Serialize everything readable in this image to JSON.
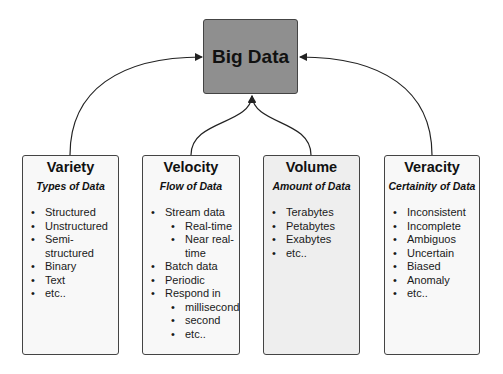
{
  "hub": {
    "title": "Big Data"
  },
  "cards": [
    {
      "title": "Variety",
      "subtitle": "Types of Data",
      "items": [
        "Structured",
        "Unstructured",
        "Semi-structured",
        "Binary",
        "Text",
        "etc.."
      ]
    },
    {
      "title": "Velocity",
      "subtitle": "Flow of Data",
      "items": [
        "Stream data",
        "Batch data",
        "Periodic",
        "Respond in"
      ],
      "stream_sub": [
        "Real-time",
        "Near real-time"
      ],
      "respond_sub": [
        "millisecond",
        "second",
        "etc.."
      ]
    },
    {
      "title": "Volume",
      "subtitle": "Amount of Data",
      "items": [
        "Terabytes",
        "Petabytes",
        "Exabytes",
        "etc.."
      ]
    },
    {
      "title": "Veracity",
      "subtitle": "Certainity of Data",
      "items": [
        "Inconsistent",
        "Incomplete",
        "Ambiguos",
        "Uncertain",
        "Biased",
        "Anomaly",
        "etc.."
      ]
    }
  ],
  "colors": {
    "hub_fill": "#8f8f8f",
    "card_fill": "#f8f8f8",
    "volume_fill": "#eeeeee",
    "stroke": "#444444"
  }
}
